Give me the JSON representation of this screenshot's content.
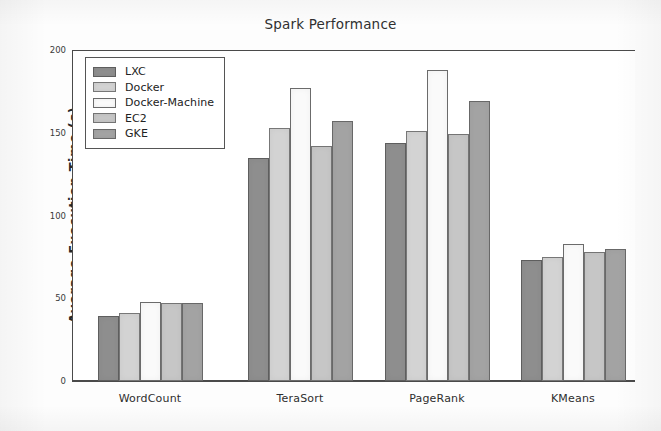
{
  "chart_data": {
    "type": "bar",
    "title": "Spark Performance",
    "xlabel": "",
    "ylabel": "Average Execution Time (s)",
    "categories": [
      "WordCount",
      "TeraSort",
      "PageRank",
      "KMeans"
    ],
    "series": [
      {
        "name": "LXC",
        "values": [
          39,
          135,
          144,
          73
        ]
      },
      {
        "name": "Docker",
        "values": [
          41,
          153,
          151,
          75
        ]
      },
      {
        "name": "Docker-Machine",
        "values": [
          48,
          177,
          188,
          83
        ]
      },
      {
        "name": "EC2",
        "values": [
          47,
          142,
          149,
          78
        ]
      },
      {
        "name": "GKE",
        "values": [
          47,
          157,
          169,
          80
        ]
      }
    ],
    "ylim": [
      0,
      200
    ],
    "yticks": [
      0,
      50,
      100,
      150,
      200
    ],
    "ytick_labels": [
      "0",
      "50",
      "100",
      "150",
      "200"
    ],
    "grid": false,
    "legend_position": "upper left",
    "series_colors": [
      "#8e8e8e",
      "#d3d3d3",
      "#fafafa",
      "#c6c6c6",
      "#a3a3a3"
    ]
  },
  "legend": {
    "items": [
      {
        "label": "LXC"
      },
      {
        "label": "Docker"
      },
      {
        "label": "Docker-Machine"
      },
      {
        "label": "EC2"
      },
      {
        "label": "GKE"
      }
    ]
  }
}
